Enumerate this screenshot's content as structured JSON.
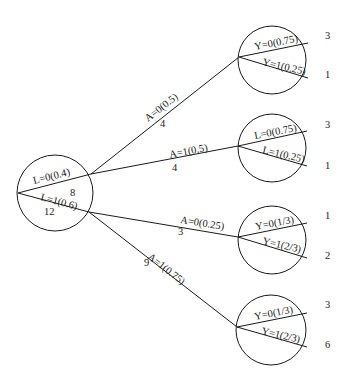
{
  "diagram": {
    "type": "decision-tree",
    "root": {
      "branches": [
        {
          "label": "L=0(0.4)",
          "count": "8"
        },
        {
          "label": "L=1(0.6)",
          "count": "12"
        }
      ]
    },
    "edges": [
      {
        "label": "A=0(0.5)",
        "count": "4"
      },
      {
        "label": "A=1(0.5)",
        "count": "4"
      },
      {
        "label": "A=0(0.25)",
        "count": "3"
      },
      {
        "label": "A=1(0.75)",
        "count": "9"
      }
    ],
    "leaves": [
      {
        "top_label": "Y=0(0.75)",
        "bottom_label": "Y=1(0.25)",
        "top_count": "3",
        "bottom_count": "1"
      },
      {
        "top_label": "L=0(0.75)",
        "bottom_label": "L=1(0.25)",
        "top_count": "3",
        "bottom_count": "1"
      },
      {
        "top_label": "Y=0(1/3)",
        "bottom_label": "Y=1(2/3)",
        "top_count": "1",
        "bottom_count": "2"
      },
      {
        "top_label": "Y=0(1/3)",
        "bottom_label": "Y=1(2/3)",
        "top_count": "3",
        "bottom_count": "6"
      }
    ]
  }
}
